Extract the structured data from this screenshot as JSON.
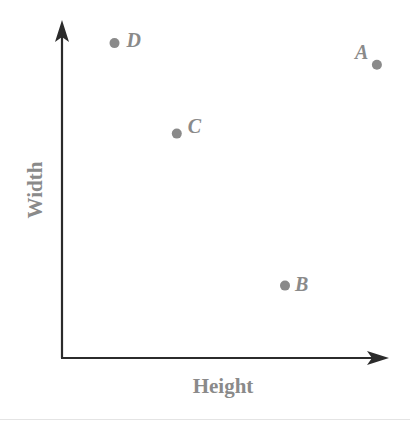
{
  "chart_data": {
    "type": "scatter",
    "title": "",
    "xlabel": "Height",
    "ylabel": "Width",
    "x_ticks": [],
    "y_ticks": [],
    "grid": false,
    "legend": null,
    "note": "Axes have no numeric ticks; values are relative positions normalized to 0-100 along each axis.",
    "xlim": [
      0,
      100
    ],
    "ylim": [
      0,
      100
    ],
    "points": [
      {
        "label": "A",
        "x": 96,
        "y": 81
      },
      {
        "label": "B",
        "x": 68,
        "y": 20
      },
      {
        "label": "C",
        "x": 35,
        "y": 62
      },
      {
        "label": "D",
        "x": 16,
        "y": 87
      }
    ],
    "colors": {
      "axis": "#2b2b2b",
      "points": "#8a8a8a",
      "labels": "#8a8a8a"
    }
  }
}
